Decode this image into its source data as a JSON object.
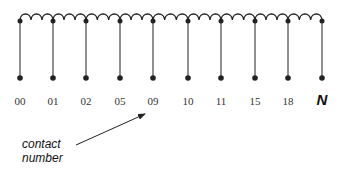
{
  "diagram": {
    "colors": {
      "line": "#222222",
      "label": "#333333"
    },
    "coil": {
      "y": 20,
      "x_start": 20,
      "x_end": 322,
      "loops_per_segment": 3
    },
    "taps": [
      {
        "x": 20,
        "label": "00"
      },
      {
        "x": 53,
        "label": "01"
      },
      {
        "x": 86,
        "label": "02"
      },
      {
        "x": 120,
        "label": "05"
      },
      {
        "x": 153,
        "label": "09"
      },
      {
        "x": 188,
        "label": "10"
      },
      {
        "x": 221,
        "label": "11"
      },
      {
        "x": 255,
        "label": "15"
      },
      {
        "x": 288,
        "label": "18"
      },
      {
        "x": 322,
        "label": "N"
      }
    ],
    "tap_bottom_y": 78,
    "label_y": 105,
    "annotation": {
      "line1": "contact",
      "line2": "number",
      "points_to": "09"
    }
  }
}
